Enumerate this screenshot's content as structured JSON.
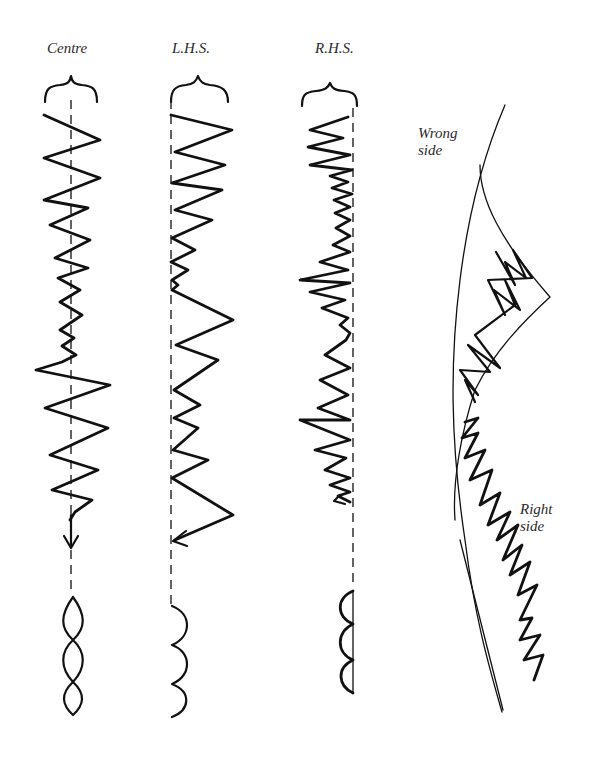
{
  "figure": {
    "type": "stitch-diagram",
    "columns": [
      {
        "id": "centre",
        "label": "Centre",
        "needle_position": "centre",
        "result_shape": "double-lens (symmetric)"
      },
      {
        "id": "lhs",
        "label": "L.H.S.",
        "needle_position": "left",
        "result_shape": "half-lens on right of line"
      },
      {
        "id": "rhs",
        "label": "R.H.S.",
        "needle_position": "right",
        "result_shape": "half-lens on left of line"
      }
    ],
    "seam": {
      "wrong_side_label": "Wrong\nside",
      "right_side_label": "Right\nside"
    }
  }
}
